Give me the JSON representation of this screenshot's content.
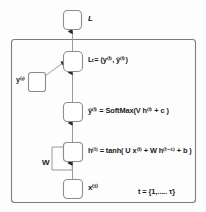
{
  "diagram": {
    "type": "rnn-unrolled-computational-graph",
    "background_color": "#fdfdfd",
    "node_fill": "#ffffff",
    "node_stroke": "#8c8c8c",
    "edge_color": "#9a9a9a",
    "arrow_color": "#2b2b2b",
    "text_color": "#1a1a1a",
    "frame_stroke": "#7d7d7d"
  },
  "labels": {
    "loss_total": "L",
    "loss_t": "Lₜ= (y⁽ᵗ⁾, ŷ⁽ᵗ⁾)",
    "y_true": "y⁽ᵗ⁾",
    "yhat_equation": "ŷ⁽ᵗ⁾ = SoftMax(V h⁽ᵗ⁾ + c )",
    "h_equation": "h⁽ᵗ⁾ = tanh( U x⁽ᵗ⁾ + W h⁽ᵗ⁻¹⁾ + b )",
    "w_weight": "W",
    "x_input": "x⁽ᵗ⁾",
    "t_range": "t = {1,..... τ}"
  },
  "nodes": [
    {
      "id": "loss-total-node",
      "label": "L",
      "x": 63,
      "y": 10,
      "w": 18,
      "h": 19
    },
    {
      "id": "loss-t-node",
      "label": "L_t",
      "x": 63,
      "y": 51,
      "w": 19,
      "h": 20
    },
    {
      "id": "y-true-node",
      "label": "y^(t)",
      "x": 28,
      "y": 72,
      "w": 17,
      "h": 19
    },
    {
      "id": "yhat-node",
      "label": "yhat^(t)",
      "x": 63,
      "y": 102,
      "w": 19,
      "h": 19
    },
    {
      "id": "h-node",
      "label": "h^(t)",
      "x": 63,
      "y": 142,
      "w": 19,
      "h": 19
    },
    {
      "id": "x-node",
      "label": "x^(t)",
      "x": 63,
      "y": 179,
      "w": 19,
      "h": 19
    }
  ],
  "frame": {
    "x": 11,
    "y": 39,
    "w": 185,
    "h": 164
  }
}
